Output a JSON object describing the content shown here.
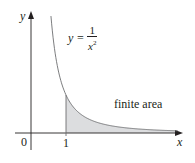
{
  "figure": {
    "type": "area-under-curve",
    "axes": {
      "x_label": "x",
      "y_label": "y",
      "origin_label": "0",
      "x_ticks": [
        "1"
      ]
    },
    "curve": {
      "equation_lhs": "y =",
      "equation_numerator": "1",
      "equation_denominator_var": "x",
      "equation_denominator_exp": "2",
      "function": "1/x^2",
      "domain_drawn": [
        0.57,
        4.2
      ]
    },
    "shaded_region": {
      "from_x": 1,
      "to_x": "infinity",
      "label": "finite area",
      "fill": "#dcdddf"
    },
    "colors": {
      "axis": "#231f20",
      "curve": "#6d6e71",
      "shade": "#dcdddf"
    }
  }
}
